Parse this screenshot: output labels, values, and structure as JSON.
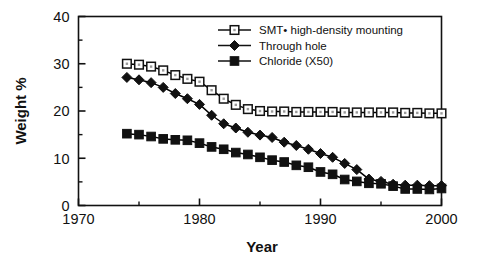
{
  "chart_data": {
    "type": "line",
    "title": "",
    "subtitle": "",
    "xlabel": "Year",
    "ylabel": "Weight %",
    "xlim": [
      1970,
      2000
    ],
    "ylim": [
      0,
      40
    ],
    "xticks": [
      1970,
      1980,
      1990,
      2000
    ],
    "xtick_labels": [
      "1970",
      "1980",
      "1990",
      "2000"
    ],
    "xminor_ticks": [
      1975,
      1985,
      1995
    ],
    "yticks": [
      0,
      10,
      20,
      30,
      40
    ],
    "ytick_labels": [
      "0",
      "10",
      "20",
      "30",
      "40"
    ],
    "yminor_ticks": [
      5,
      15,
      25,
      35
    ],
    "grid": false,
    "legend_position": "upper right",
    "frame": true,
    "series": [
      {
        "name": "SMT• high-density mounting",
        "marker": "open-square",
        "color": "#000000",
        "x": [
          1974,
          1975,
          1976,
          1977,
          1978,
          1979,
          1980,
          1981,
          1982,
          1983,
          1984,
          1985,
          1986,
          1987,
          1988,
          1989,
          1990,
          1991,
          1992,
          1993,
          1994,
          1995,
          1996,
          1997,
          1998,
          1999,
          2000
        ],
        "values": [
          30.0,
          29.8,
          29.4,
          28.6,
          27.6,
          26.8,
          26.2,
          24.4,
          22.6,
          21.3,
          20.4,
          20.0,
          19.9,
          19.9,
          19.8,
          19.8,
          19.8,
          19.8,
          19.7,
          19.7,
          19.7,
          19.7,
          19.7,
          19.6,
          19.6,
          19.5,
          19.5
        ]
      },
      {
        "name": "Through hole",
        "marker": "filled-diamond",
        "color": "#000000",
        "x": [
          1974,
          1975,
          1976,
          1977,
          1978,
          1979,
          1980,
          1981,
          1982,
          1983,
          1984,
          1985,
          1986,
          1987,
          1988,
          1989,
          1990,
          1991,
          1992,
          1993,
          1994,
          1995,
          1996,
          1997,
          1998,
          1999,
          2000
        ],
        "values": [
          27.1,
          26.6,
          26.0,
          25.0,
          23.7,
          22.6,
          21.4,
          19.1,
          17.3,
          16.4,
          15.5,
          14.9,
          14.4,
          13.4,
          12.7,
          11.9,
          11.0,
          10.2,
          8.9,
          7.6,
          5.6,
          5.1,
          4.5,
          4.3,
          4.3,
          4.2,
          4.2
        ]
      },
      {
        "name": "Chloride (X50)",
        "marker": "filled-square",
        "color": "#000000",
        "x": [
          1974,
          1975,
          1976,
          1977,
          1978,
          1979,
          1980,
          1981,
          1982,
          1983,
          1984,
          1985,
          1986,
          1987,
          1988,
          1989,
          1990,
          1991,
          1992,
          1993,
          1994,
          1995,
          1996,
          1997,
          1998,
          1999,
          2000
        ],
        "values": [
          15.2,
          15.0,
          14.6,
          14.1,
          13.9,
          13.8,
          13.2,
          12.4,
          11.9,
          11.2,
          10.8,
          10.2,
          9.6,
          9.2,
          8.5,
          8.1,
          7.1,
          6.6,
          5.5,
          5.1,
          4.7,
          4.6,
          4.1,
          3.5,
          3.5,
          3.4,
          3.6
        ]
      }
    ]
  },
  "legend": {
    "items": [
      {
        "label": "SMT• high-density mounting",
        "marker": "open-square"
      },
      {
        "label": "Through hole",
        "marker": "filled-diamond"
      },
      {
        "label": "Chloride (X50)",
        "marker": "filled-square"
      }
    ]
  },
  "axes": {
    "x_title": "Year",
    "y_title": "Weight %"
  }
}
